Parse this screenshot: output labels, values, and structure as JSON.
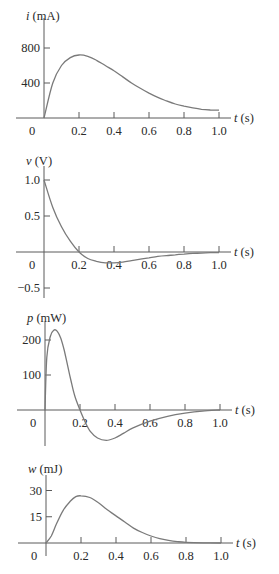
{
  "chart_data": [
    {
      "type": "line",
      "var": "i",
      "unit": "(mA)",
      "ylabel": "i (mA)",
      "xlabel": "t (s)",
      "x_ticks": [
        "0.2",
        "0.4",
        "0.6",
        "0.8",
        "1.0"
      ],
      "origin_label": "0",
      "y_ticks": [
        {
          "value": 800,
          "label": "800"
        },
        {
          "value": 400,
          "label": "400"
        }
      ],
      "xlim": [
        0,
        1.0
      ],
      "ylim": [
        0,
        900
      ],
      "x": [
        0,
        0.05,
        0.1,
        0.15,
        0.2,
        0.25,
        0.3,
        0.35,
        0.4,
        0.45,
        0.5,
        0.55,
        0.6,
        0.65,
        0.7,
        0.75,
        0.8,
        0.85,
        0.9,
        0.95,
        1.0
      ],
      "y": [
        0,
        400,
        600,
        690,
        720,
        705,
        660,
        600,
        540,
        470,
        400,
        340,
        285,
        235,
        195,
        160,
        135,
        115,
        100,
        92,
        90
      ]
    },
    {
      "type": "line",
      "var": "v",
      "unit": "(V)",
      "ylabel": "v (V)",
      "xlabel": "t (s)",
      "x_ticks": [
        "0.2",
        "0.4",
        "0.6",
        "0.8",
        "1.0"
      ],
      "origin_label": "0",
      "y_ticks": [
        {
          "value": 1.0,
          "label": "1.0"
        },
        {
          "value": 0.5,
          "label": "0.5"
        },
        {
          "value": -0.5,
          "label": "−0.5"
        }
      ],
      "xlim": [
        0,
        1.0
      ],
      "ylim": [
        -0.5,
        1.2
      ],
      "x": [
        0,
        0.05,
        0.1,
        0.15,
        0.2,
        0.25,
        0.3,
        0.35,
        0.4,
        0.45,
        0.5,
        0.55,
        0.6,
        0.65,
        0.7,
        0.75,
        0.8,
        0.85,
        0.9,
        0.95,
        1.0
      ],
      "y": [
        1.0,
        0.62,
        0.35,
        0.15,
        0.0,
        -0.09,
        -0.13,
        -0.15,
        -0.15,
        -0.14,
        -0.12,
        -0.1,
        -0.08,
        -0.06,
        -0.05,
        -0.04,
        -0.03,
        -0.02,
        -0.015,
        -0.01,
        -0.01
      ]
    },
    {
      "type": "line",
      "var": "p",
      "unit": "(mW)",
      "ylabel": "p (mW)",
      "xlabel": "t (s)",
      "x_ticks": [
        "0.2",
        "0.4",
        "0.6",
        "0.8",
        "1.0"
      ],
      "origin_label": "0",
      "y_ticks": [
        {
          "value": 200,
          "label": "200"
        },
        {
          "value": 100,
          "label": "100"
        }
      ],
      "xlim": [
        0,
        1.0
      ],
      "ylim": [
        -90,
        250
      ],
      "x": [
        0,
        0.01,
        0.03,
        0.05,
        0.07,
        0.09,
        0.11,
        0.13,
        0.15,
        0.17,
        0.2,
        0.23,
        0.26,
        0.3,
        0.35,
        0.4,
        0.45,
        0.5,
        0.6,
        0.7,
        0.8,
        0.9,
        1.0
      ],
      "y": [
        0,
        150,
        210,
        228,
        225,
        205,
        170,
        125,
        80,
        40,
        0,
        -35,
        -62,
        -80,
        -87,
        -80,
        -66,
        -52,
        -32,
        -18,
        -9,
        -3,
        0
      ]
    },
    {
      "type": "line",
      "var": "w",
      "unit": "(mJ)",
      "ylabel": "w (mJ)",
      "xlabel": "t (s)",
      "x_ticks": [
        "0.2",
        "0.4",
        "0.6",
        "0.8",
        "1.0"
      ],
      "origin_label": "0",
      "y_ticks": [
        {
          "value": 30,
          "label": "30"
        },
        {
          "value": 15,
          "label": "15"
        }
      ],
      "xlim": [
        0,
        1.0
      ],
      "ylim": [
        0,
        36
      ],
      "x": [
        0,
        0.03,
        0.06,
        0.1,
        0.14,
        0.17,
        0.2,
        0.25,
        0.3,
        0.35,
        0.4,
        0.45,
        0.5,
        0.55,
        0.6,
        0.65,
        0.7,
        0.75,
        0.8,
        0.9,
        1.0
      ],
      "y": [
        0,
        4,
        11,
        19,
        24,
        26.5,
        27,
        26,
        23,
        19,
        15.5,
        12,
        8.5,
        6,
        4,
        2.5,
        1.5,
        0.8,
        0.4,
        0.1,
        0
      ]
    }
  ],
  "layout": [
    {
      "x0": 44,
      "y0": 118,
      "px_per_t": 175,
      "px_per_unit": 0.0875,
      "top": 18,
      "bottom": 118,
      "label_y": 20
    },
    {
      "x0": 44,
      "y0": 252,
      "px_per_t": 175,
      "px_per_unit": 72,
      "top": 166,
      "bottom": 298,
      "label_y": 165
    },
    {
      "x0": 45,
      "y0": 410,
      "px_per_t": 175,
      "px_per_unit": 0.35,
      "top": 322,
      "bottom": 446,
      "label_y": 322
    },
    {
      "x0": 46,
      "y0": 543,
      "px_per_t": 175,
      "px_per_unit": 1.75,
      "top": 475,
      "bottom": 556,
      "label_y": 473
    }
  ]
}
